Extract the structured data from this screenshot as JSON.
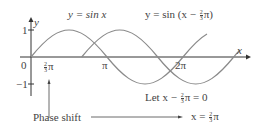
{
  "diagram": {
    "legend": {
      "curve1": "y = sin x",
      "curve2_prefix": "y = sin (x −",
      "curve2_suffix": "π)"
    },
    "axes": {
      "x_label": "x",
      "y_label": "y",
      "y_tick_1": "1",
      "y_tick_neg1": "−1",
      "origin": "0",
      "x_tick_pi": "π",
      "x_tick_2pi": "2π",
      "x_tick_shift_suffix": "π"
    },
    "fraction": {
      "num": "2",
      "den": "3"
    },
    "annotations": {
      "phase_shift": "Phase shift",
      "let_prefix": "Let x −",
      "let_suffix": "π = 0",
      "result_prefix": "x =",
      "result_suffix": "π"
    },
    "colors": {
      "curve": "#8a8a8a",
      "axis": "#333333",
      "text": "#444444"
    }
  }
}
